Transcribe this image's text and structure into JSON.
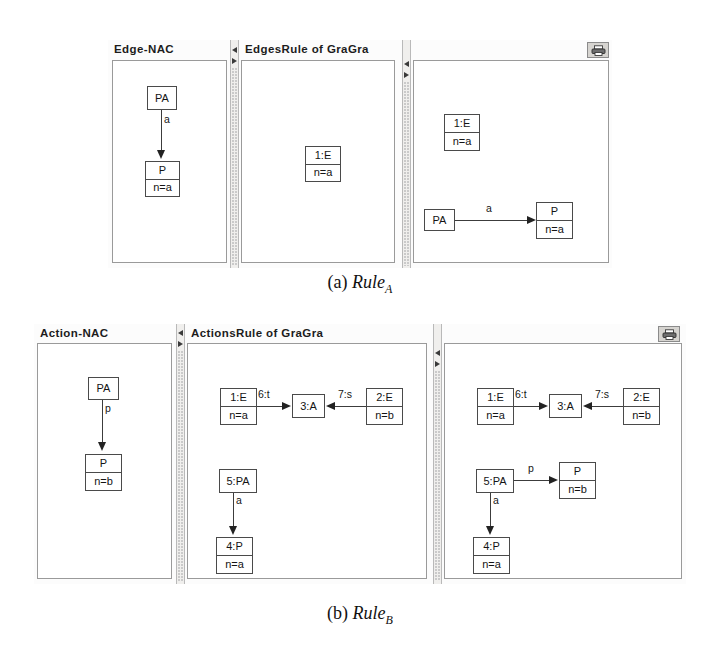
{
  "page": {
    "background": "#ffffff",
    "width": 720,
    "height": 651
  },
  "figures": [
    {
      "id": "rule-a",
      "caption_prefix": "(a)",
      "caption_name": "Rule",
      "caption_sub": "A",
      "toolbutton": "printer-icon",
      "panes": [
        {
          "id": "edge-nac",
          "title": "Edge-NAC",
          "nodes": [
            {
              "id": "pa",
              "lines": [
                "PA"
              ]
            },
            {
              "id": "p-na",
              "lines": [
                "P",
                "n=a"
              ]
            }
          ],
          "edges": [
            {
              "from": "pa",
              "to": "p-na",
              "label": "a",
              "direction": "down"
            }
          ]
        },
        {
          "id": "edges-rule-lhs",
          "title": "EdgesRule of GraGra",
          "nodes": [
            {
              "id": "e1",
              "lines": [
                "1:E",
                "n=a"
              ]
            }
          ],
          "edges": []
        },
        {
          "id": "edges-rule-rhs",
          "title": "",
          "nodes": [
            {
              "id": "e1r",
              "lines": [
                "1:E",
                "n=a"
              ]
            },
            {
              "id": "par",
              "lines": [
                "PA"
              ]
            },
            {
              "id": "pr",
              "lines": [
                "P",
                "n=a"
              ]
            }
          ],
          "edges": [
            {
              "from": "par",
              "to": "pr",
              "label": "a",
              "direction": "right"
            }
          ]
        }
      ]
    },
    {
      "id": "rule-b",
      "caption_prefix": "(b)",
      "caption_name": "Rule",
      "caption_sub": "B",
      "toolbutton": "printer-icon",
      "panes": [
        {
          "id": "action-nac",
          "title": "Action-NAC",
          "nodes": [
            {
              "id": "pa",
              "lines": [
                "PA"
              ]
            },
            {
              "id": "p-nb",
              "lines": [
                "P",
                "n=b"
              ]
            }
          ],
          "edges": [
            {
              "from": "pa",
              "to": "p-nb",
              "label": "p",
              "direction": "down"
            }
          ]
        },
        {
          "id": "actions-rule-lhs",
          "title": "ActionsRule of GraGra",
          "nodes": [
            {
              "id": "e1",
              "lines": [
                "1:E",
                "n=a"
              ]
            },
            {
              "id": "a3",
              "lines": [
                "3:A"
              ]
            },
            {
              "id": "e2",
              "lines": [
                "2:E",
                "n=b"
              ]
            },
            {
              "id": "pa5",
              "lines": [
                "5:PA"
              ]
            },
            {
              "id": "p4",
              "lines": [
                "4:P",
                "n=a"
              ]
            }
          ],
          "edges": [
            {
              "from": "e1",
              "to": "a3",
              "label": "6:t",
              "direction": "right"
            },
            {
              "from": "e2",
              "to": "a3",
              "label": "7:s",
              "direction": "left"
            },
            {
              "from": "pa5",
              "to": "p4",
              "label": "a",
              "direction": "down"
            }
          ]
        },
        {
          "id": "actions-rule-rhs",
          "title": "",
          "nodes": [
            {
              "id": "e1",
              "lines": [
                "1:E",
                "n=a"
              ]
            },
            {
              "id": "a3",
              "lines": [
                "3:A"
              ]
            },
            {
              "id": "e2",
              "lines": [
                "2:E",
                "n=b"
              ]
            },
            {
              "id": "pa5",
              "lines": [
                "5:PA"
              ]
            },
            {
              "id": "pnb",
              "lines": [
                "P",
                "n=b"
              ]
            },
            {
              "id": "p4",
              "lines": [
                "4:P",
                "n=a"
              ]
            }
          ],
          "edges": [
            {
              "from": "e1",
              "to": "a3",
              "label": "6:t",
              "direction": "right"
            },
            {
              "from": "e2",
              "to": "a3",
              "label": "7:s",
              "direction": "left"
            },
            {
              "from": "pa5",
              "to": "pnb",
              "label": "p",
              "direction": "right"
            },
            {
              "from": "pa5",
              "to": "p4",
              "label": "a",
              "direction": "down"
            }
          ]
        }
      ]
    }
  ]
}
